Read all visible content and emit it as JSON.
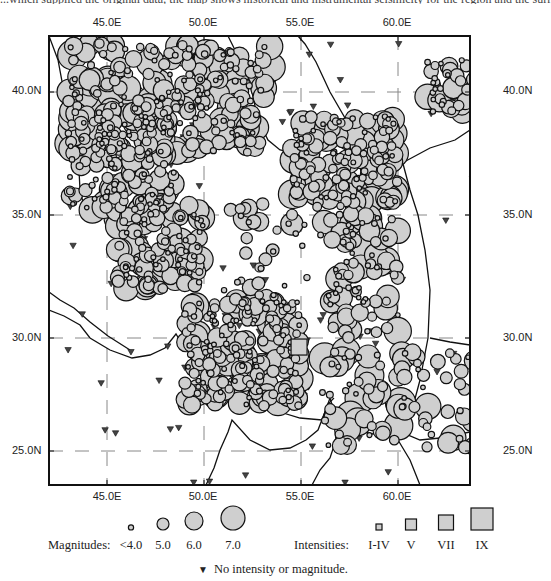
{
  "header_fragment": "...which supplied the original data; the map shows historical and instrumental seismicity for the region and the surrounding ...",
  "map": {
    "lon_labels": [
      "45.0E",
      "50.0E",
      "55.0E",
      "60.0E"
    ],
    "lat_labels": [
      "40.0N",
      "35.0N",
      "30.0N",
      "25.0N"
    ],
    "lon_range": [
      42.8,
      64.5
    ],
    "lat_range": [
      23.5,
      42.0
    ],
    "lon_ticks": [
      45,
      50,
      55,
      60
    ],
    "lat_ticks": [
      40,
      35,
      30,
      25
    ],
    "colors": {
      "fill": "#cfcfcf",
      "stroke": "#111111",
      "grid": "#888888",
      "frame": "#111111"
    },
    "seismic_zones": [
      {
        "name": "caucasus-alborz",
        "lon": [
          43.0,
          53.5
        ],
        "lat": [
          37.5,
          42.0
        ],
        "count": 260,
        "mags": [
          4.0,
          7.0
        ]
      },
      {
        "name": "northwest-iran",
        "lon": [
          43.0,
          48.5
        ],
        "lat": [
          35.2,
          39.5
        ],
        "count": 160,
        "mags": [
          4.0,
          7.0
        ]
      },
      {
        "name": "zagros-north",
        "lon": [
          45.5,
          50.0
        ],
        "lat": [
          32.0,
          35.5
        ],
        "count": 130,
        "mags": [
          4.0,
          6.8
        ]
      },
      {
        "name": "zagros-south",
        "lon": [
          49.0,
          55.0
        ],
        "lat": [
          27.0,
          31.5
        ],
        "count": 230,
        "mags": [
          4.0,
          6.8
        ]
      },
      {
        "name": "kopet-dag",
        "lon": [
          54.5,
          60.0
        ],
        "lat": [
          35.5,
          39.0
        ],
        "count": 170,
        "mags": [
          4.0,
          7.0
        ]
      },
      {
        "name": "central-iran",
        "lon": [
          51.0,
          58.0
        ],
        "lat": [
          31.0,
          35.5
        ],
        "count": 60,
        "mags": [
          4.0,
          6.5
        ]
      },
      {
        "name": "east-iran",
        "lon": [
          56.5,
          60.0
        ],
        "lat": [
          30.0,
          35.0
        ],
        "count": 80,
        "mags": [
          4.0,
          6.8
        ]
      },
      {
        "name": "makran",
        "lon": [
          56.0,
          64.0
        ],
        "lat": [
          25.0,
          29.5
        ],
        "count": 90,
        "mags": [
          4.0,
          7.2
        ]
      },
      {
        "name": "hindu-kush",
        "lon": [
          61.5,
          64.5
        ],
        "lat": [
          39.2,
          41.5
        ],
        "count": 45,
        "mags": [
          4.0,
          6.5
        ]
      }
    ],
    "intensity_points": [
      {
        "lon": 54.9,
        "lat": 29.6,
        "intensity": "VII"
      }
    ],
    "no_data_count": 110
  },
  "legend": {
    "magnitudes_label": "Magnitudes:",
    "magnitudes": [
      "<4.0",
      "5.0",
      "6.0",
      "7.0"
    ],
    "magnitude_values": [
      4.0,
      5.0,
      6.0,
      7.0
    ],
    "intensities_label": "Intensities:",
    "intensities": [
      "I-IV",
      "V",
      "VII",
      "IX"
    ],
    "no_data_label": "No intensity or magnitude."
  }
}
